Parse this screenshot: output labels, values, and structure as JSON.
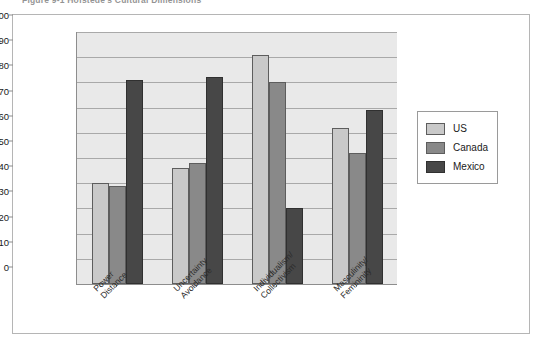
{
  "figure": {
    "caption": "Figure 9-1   Hofstede's Cultural Dimensions"
  },
  "legend": {
    "position": "right",
    "items": [
      {
        "label": "US",
        "color": "#c9c9c9"
      },
      {
        "label": "Canada",
        "color": "#898989"
      },
      {
        "label": "Mexico",
        "color": "#474747"
      }
    ]
  },
  "axis": {
    "y_ticks": [
      "0",
      "10",
      "20",
      "30",
      "40",
      "50",
      "60",
      "70",
      "80",
      "90",
      "100"
    ],
    "x_categories": [
      [
        "Power",
        "Distance"
      ],
      [
        "Uncertainty",
        "Avoidance"
      ],
      [
        "Individualism/",
        "Collectivism"
      ],
      [
        "Masculinity/",
        "Femininity"
      ]
    ]
  },
  "chart_data": {
    "type": "bar",
    "title": "Figure 9-1   Hofstede's Cultural Dimensions",
    "xlabel": "",
    "ylabel": "",
    "ylim": [
      0,
      100
    ],
    "ytick_step": 10,
    "grid": true,
    "legend_position": "right",
    "categories": [
      "Power Distance",
      "Uncertainty Avoidance",
      "Individualism/Collectivism",
      "Masculinity/Femininity"
    ],
    "series": [
      {
        "name": "US",
        "color": "#c9c9c9",
        "values": [
          40,
          46,
          91,
          62
        ]
      },
      {
        "name": "Canada",
        "color": "#898989",
        "values": [
          39,
          48,
          80,
          52
        ]
      },
      {
        "name": "Mexico",
        "color": "#474747",
        "values": [
          81,
          82,
          30,
          69
        ]
      }
    ]
  }
}
